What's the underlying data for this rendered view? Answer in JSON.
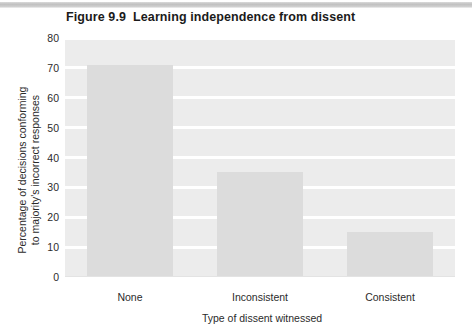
{
  "figure": {
    "number": "Figure 9.9",
    "title": "Learning independence from dissent"
  },
  "colors": {
    "plot_background": "#ececec",
    "gridline": "#ffffff",
    "bar_fill": "#dcdcdc",
    "text": "#1a1a1a"
  },
  "chart_data": {
    "type": "bar",
    "xlabel": "Type of dissent witnessed",
    "ylabel": "Percentage of decisions conforming to majority's incorrect responses",
    "ylabel_line1": "Percentage of decisions conforming",
    "ylabel_line2": "to majority's incorrect responses",
    "categories": [
      "None",
      "Inconsistent",
      "Consistent"
    ],
    "values": [
      71,
      35,
      15
    ],
    "ylim": [
      0,
      80
    ],
    "ytick_values": [
      0,
      10,
      20,
      30,
      40,
      50,
      60,
      70,
      80
    ],
    "ytick_labels": [
      "0",
      "10",
      "20",
      "30",
      "40",
      "50",
      "60",
      "70",
      "80"
    ],
    "grid": true,
    "legend": null,
    "series_name": "Percentage conforming"
  }
}
